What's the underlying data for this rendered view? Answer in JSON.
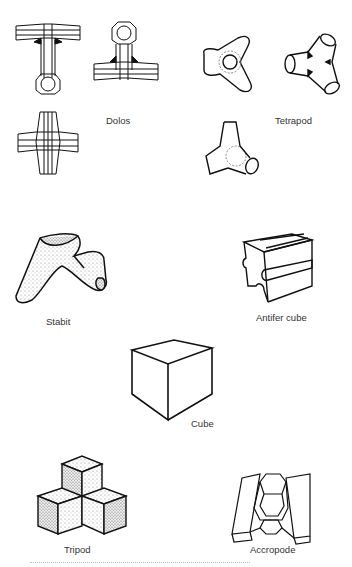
{
  "figure": {
    "units": [
      {
        "id": "dolos",
        "label": "Dolos"
      },
      {
        "id": "tetrapod",
        "label": "Tetrapod"
      },
      {
        "id": "stabit",
        "label": "Stabit"
      },
      {
        "id": "antifer_cube",
        "label": "Antifer cube"
      },
      {
        "id": "cube",
        "label": "Cube"
      },
      {
        "id": "tripod",
        "label": "Tripod"
      },
      {
        "id": "accropode",
        "label": "Accropode"
      }
    ],
    "colors": {
      "line": "#111111",
      "background": "#ffffff",
      "stipple": "#9a9a9a"
    }
  }
}
